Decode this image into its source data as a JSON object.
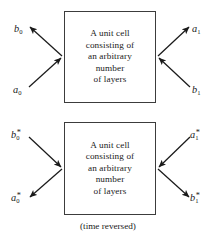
{
  "figure": {
    "caption": "(time reversed)",
    "line_color": "#1a1a1a",
    "box_border_color": "#3c3c3c",
    "background_color": "#ffffff"
  },
  "boxes": [
    {
      "id": "forward",
      "lines": [
        "A unit cell",
        "consisting of",
        "an arbitrary",
        "number",
        "of layers"
      ]
    },
    {
      "id": "time-reversed",
      "lines": [
        "A unit cell",
        "consisting of",
        "an arbitrary",
        "number",
        "of layers"
      ]
    }
  ],
  "ports": {
    "forward": [
      {
        "id": "b0",
        "symbol": "b",
        "subscript": "0",
        "superscript": "",
        "text": "b0",
        "side": "left",
        "direction": "outgoing"
      },
      {
        "id": "a0",
        "symbol": "a",
        "subscript": "0",
        "superscript": "",
        "text": "a0",
        "side": "left",
        "direction": "incoming"
      },
      {
        "id": "a1",
        "symbol": "a",
        "subscript": "1",
        "superscript": "",
        "text": "a1",
        "side": "right",
        "direction": "outgoing"
      },
      {
        "id": "b1",
        "symbol": "b",
        "subscript": "1",
        "superscript": "",
        "text": "b1",
        "side": "right",
        "direction": "incoming"
      }
    ],
    "time_reversed": [
      {
        "id": "b0s",
        "symbol": "b",
        "subscript": "0",
        "superscript": "*",
        "text": "b0*",
        "side": "left",
        "direction": "incoming"
      },
      {
        "id": "a0s",
        "symbol": "a",
        "subscript": "0",
        "superscript": "*",
        "text": "a0*",
        "side": "left",
        "direction": "outgoing"
      },
      {
        "id": "a1s",
        "symbol": "a",
        "subscript": "1",
        "superscript": "*",
        "text": "a1*",
        "side": "right",
        "direction": "incoming"
      },
      {
        "id": "b1s",
        "symbol": "b",
        "subscript": "1",
        "superscript": "*",
        "text": "b1*",
        "side": "right",
        "direction": "outgoing"
      }
    ]
  }
}
